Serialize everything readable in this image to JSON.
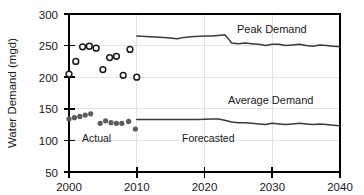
{
  "chart_data": {
    "type": "scatter",
    "title": "",
    "xlabel": "",
    "ylabel": "Water Demand (mgd)",
    "xlim": [
      2000,
      2040
    ],
    "ylim": [
      50,
      300
    ],
    "xticks": [
      2000,
      2010,
      2020,
      2030,
      2040
    ],
    "yticks": [
      50,
      100,
      150,
      200,
      250,
      300
    ],
    "grid": true,
    "legend_position": "inline-annotations",
    "annotations": [
      {
        "text": "Peak Demand",
        "x": 2026,
        "y": 272
      },
      {
        "text": "Average Demand",
        "x": 2026,
        "y": 152
      },
      {
        "text": "Actual",
        "x": 2004,
        "y": 92
      },
      {
        "text": "Forecasted",
        "x": 2019.5,
        "y": 92
      }
    ],
    "series": [
      {
        "name": "Peak Demand",
        "kind": "scatter",
        "marker": "open-circle",
        "period": "Actual",
        "x": [
          2000,
          2001,
          2002,
          2003,
          2004,
          2005,
          2006,
          2007,
          2008,
          2009,
          2010
        ],
        "values": [
          205,
          225,
          248,
          249,
          246,
          212,
          231,
          233,
          203,
          244,
          200
        ]
      },
      {
        "name": "Average Demand",
        "kind": "scatter",
        "marker": "filled-circle",
        "period": "Actual",
        "x": [
          2000,
          2000.8,
          2001.6,
          2002.4,
          2003.2,
          2004.6,
          2005.4,
          2006.2,
          2007,
          2007.8,
          2008.8,
          2009.8
        ],
        "values": [
          134,
          136,
          138,
          140,
          142,
          127,
          131,
          128,
          127,
          127,
          130,
          118
        ]
      },
      {
        "name": "Peak Demand",
        "kind": "line",
        "period": "Forecasted",
        "x": [
          2010,
          2012,
          2014,
          2016,
          2017,
          2018,
          2020,
          2021,
          2022,
          2023,
          2023.5,
          2024,
          2025,
          2026,
          2027,
          2028,
          2029,
          2030,
          2031,
          2032,
          2033,
          2034,
          2035,
          2036,
          2037,
          2038,
          2039,
          2040
        ],
        "values": [
          265,
          264,
          263,
          261,
          263,
          264,
          265,
          265,
          266,
          267,
          261,
          254,
          253,
          254,
          253,
          252,
          250,
          252,
          252,
          250,
          251,
          252,
          250,
          249,
          251,
          250,
          249,
          248
        ]
      },
      {
        "name": "Average Demand",
        "kind": "line",
        "period": "Forecasted",
        "x": [
          2010,
          2013,
          2016,
          2019,
          2021,
          2022,
          2023,
          2024,
          2025,
          2026,
          2027,
          2028,
          2029,
          2030,
          2031,
          2032,
          2033,
          2034,
          2035,
          2036,
          2037,
          2038,
          2039,
          2040
        ],
        "values": [
          133,
          133,
          133,
          133,
          134,
          134,
          132,
          129,
          128,
          128,
          127,
          126,
          125,
          127,
          126,
          125,
          126,
          127,
          126,
          125,
          126,
          125,
          124,
          123
        ]
      }
    ]
  },
  "axis": {
    "y_title": "Water Demand (mgd)",
    "y_tick_labels": [
      "300",
      "250",
      "200",
      "150",
      "100",
      "50"
    ],
    "x_tick_labels": [
      "2000",
      "2010",
      "2020",
      "2030",
      "2040"
    ]
  },
  "labels": {
    "peak_demand": "Peak Demand",
    "average_demand": "Average Demand",
    "actual": "Actual",
    "forecasted": "Forecasted"
  },
  "colors": {
    "axis": "#000000",
    "grid": "#e3e3e3",
    "line": "#3a3a3a",
    "marker_open_stroke": "#1a1a1a",
    "marker_filled": "#5a5a5a",
    "text": "#1a1a1a",
    "background": "#ffffff"
  }
}
